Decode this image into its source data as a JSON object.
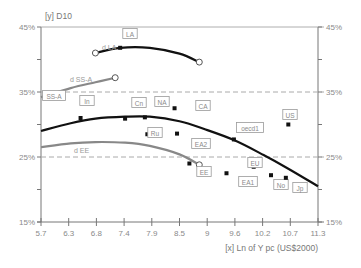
{
  "chart_data": {
    "type": "scatter",
    "title": "",
    "ylabel": "[y] D10",
    "xlabel": "[x] Ln of Y pc (US$2000)",
    "xlim": [
      5.7,
      11.3
    ],
    "ylim": [
      15,
      45
    ],
    "x_ticks": [
      "5.7",
      "6.3",
      "6.8",
      "7.4",
      "7.9",
      "8.5",
      "9",
      "9.6",
      "10.2",
      "10.7",
      "11.3"
    ],
    "y_ticks_left": [
      "15%",
      "25%",
      "35%",
      "45%"
    ],
    "y_ticks_right": [
      "15%",
      "25%",
      "35%",
      "45%"
    ],
    "reference_lines": [
      25,
      35
    ],
    "grid": false,
    "points": [
      {
        "label": "LA",
        "x": 7.3,
        "y": 41.8
      },
      {
        "label": "SS-A",
        "x": 6.0,
        "y": 34.5
      },
      {
        "label": "In",
        "x": 6.5,
        "y": 31.0
      },
      {
        "label": "Cn",
        "x": 7.4,
        "y": 30.9
      },
      {
        "label": "NA",
        "x": 7.8,
        "y": 31.1
      },
      {
        "label": "CA",
        "x": 8.4,
        "y": 32.5
      },
      {
        "label": "Ru",
        "x": 7.85,
        "y": 28.5
      },
      {
        "label": "EA2",
        "x": 8.45,
        "y": 28.6
      },
      {
        "label": "EE",
        "x": 8.7,
        "y": 24.0
      },
      {
        "label": "oecd1",
        "x": 9.6,
        "y": 27.7
      },
      {
        "label": "US",
        "x": 10.7,
        "y": 30.0
      },
      {
        "label": "EU",
        "x": 10.0,
        "y": 23.5
      },
      {
        "label": "EA1",
        "x": 9.45,
        "y": 22.5
      },
      {
        "label": "No",
        "x": 10.35,
        "y": 22.2
      },
      {
        "label": "Jp",
        "x": 10.65,
        "y": 21.8
      }
    ],
    "series": [
      {
        "name": "d LA",
        "color": "#111111",
        "x": [
          6.8,
          7.3,
          7.9,
          8.5,
          8.9
        ],
        "y": [
          41.0,
          41.8,
          41.8,
          40.9,
          39.6
        ]
      },
      {
        "name": "d SS-A",
        "color": "#888888",
        "x": [
          5.7,
          6.3,
          6.8,
          7.2
        ],
        "y": [
          34.2,
          35.6,
          36.5,
          37.2
        ]
      },
      {
        "name": "d EE",
        "color": "#888888",
        "x": [
          5.7,
          6.3,
          6.8,
          7.4,
          7.9,
          8.5,
          8.9
        ],
        "y": [
          26.5,
          27.1,
          27.3,
          27.2,
          26.7,
          25.4,
          23.8
        ]
      },
      {
        "name": "oecd fit",
        "color": "#111111",
        "x": [
          5.7,
          6.3,
          6.8,
          7.4,
          7.9,
          8.5,
          9.0,
          9.6,
          10.2,
          10.7,
          11.3
        ],
        "y": [
          29.0,
          30.2,
          30.9,
          31.2,
          31.2,
          30.5,
          29.3,
          27.6,
          25.3,
          23.2,
          20.5
        ]
      }
    ],
    "curve_labels": [
      "d LA",
      "d SS-A",
      "d EE"
    ]
  }
}
